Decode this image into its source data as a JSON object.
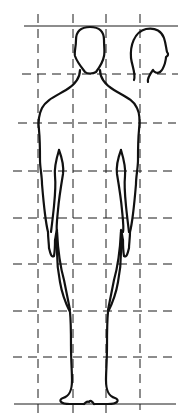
{
  "diagram": {
    "title": "Human figure proportions",
    "grid": {
      "horizontal_lines_y": [
        26,
        74,
        123,
        171,
        218,
        264,
        311,
        357,
        404
      ],
      "vertical_lines_x": [
        38,
        73,
        106,
        140
      ],
      "unit": "head height",
      "heads_tall": 8
    },
    "colors": {
      "background": "#ffffff",
      "line": "#111111"
    },
    "elements": {
      "front_figure": "front view outline",
      "profile_head": "side view head"
    }
  }
}
